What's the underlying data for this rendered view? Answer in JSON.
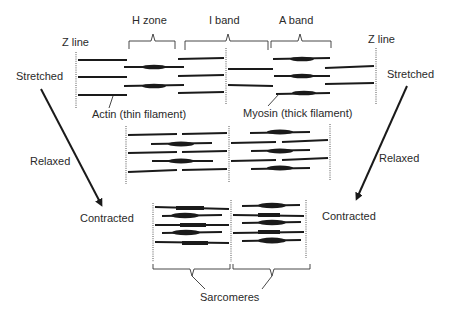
{
  "diagram": {
    "labels": {
      "z_line_left": "Z line",
      "z_line_right": "Z line",
      "h_zone": "H zone",
      "i_band": "I band",
      "a_band": "A band",
      "stretched_left": "Stretched",
      "stretched_right": "Stretched",
      "actin": "Actin (thin filament)",
      "myosin": "Myosin (thick filament)",
      "relaxed_left": "Relaxed",
      "relaxed_right": "Relaxed",
      "contracted_left": "Contracted",
      "contracted_right": "Contracted",
      "sarcomeres": "Sarcomeres"
    },
    "states": [
      "Stretched",
      "Relaxed",
      "Contracted"
    ],
    "colors": {
      "filament": "#1a1a1a",
      "z_line": "#555555",
      "text": "#2a2a2a",
      "background": "#ffffff"
    }
  }
}
